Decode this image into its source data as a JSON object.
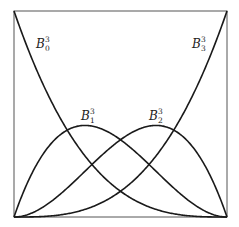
{
  "diagram": {
    "box": {
      "x": 14,
      "y": 11,
      "width": 213,
      "height": 206
    },
    "stroke_color": "#1a1a1a",
    "frame_color": "#555555",
    "curves": [
      {
        "id": "B0",
        "name": "B",
        "sub": "0",
        "sup": "3",
        "label_x": 36,
        "label_y": 48,
        "coeffs": [
          1,
          0,
          0,
          0
        ]
      },
      {
        "id": "B1",
        "name": "B",
        "sub": "1",
        "sup": "3",
        "label_x": 81,
        "label_y": 120,
        "coeffs": [
          0,
          1,
          0,
          0
        ]
      },
      {
        "id": "B2",
        "name": "B",
        "sub": "2",
        "sup": "3",
        "label_x": 149,
        "label_y": 120,
        "coeffs": [
          0,
          0,
          1,
          0
        ]
      },
      {
        "id": "B3",
        "name": "B",
        "sub": "3",
        "sup": "3",
        "label_x": 192,
        "label_y": 48,
        "coeffs": [
          0,
          0,
          0,
          1
        ]
      }
    ]
  }
}
